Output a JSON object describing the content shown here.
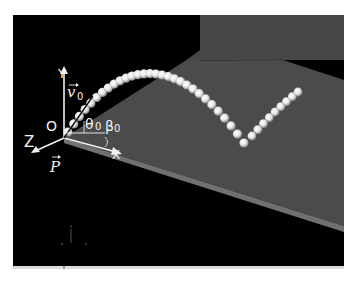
{
  "scene": {
    "title": "Projectile launched onto inclined plane",
    "background_color": "#000000",
    "plane_color": "#4a4a4a",
    "plane_edge_color": "#6e6e6e",
    "ball_color": "#f4f4f4"
  },
  "labels": {
    "origin": "O",
    "axis_x": "X",
    "axis_y": "Y",
    "axis_z": "Z",
    "velocity": "v",
    "velocity_subscript": "0",
    "theta": "θ",
    "theta_subscript": "0",
    "beta": "β",
    "beta_subscript": "0",
    "normal": "P"
  },
  "mini_axes": {
    "y": "y",
    "z": "z",
    "x": "x"
  },
  "trajectory": {
    "description": "ball positions along flight then bounce",
    "first_arc_count": 30,
    "second_arc_count": 9
  }
}
